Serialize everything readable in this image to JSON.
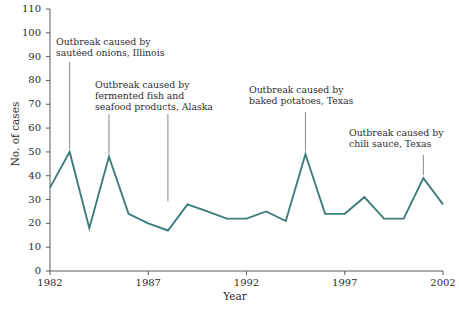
{
  "chart_data": {
    "type": "line",
    "title": "",
    "xlabel": "Year",
    "ylabel": "No. of cases",
    "xlim": [
      1982,
      2002
    ],
    "ylim": [
      0,
      110
    ],
    "grid": false,
    "legend": null,
    "line_color": "#3d7d7d",
    "x": [
      1982,
      1983,
      1984,
      1985,
      1986,
      1987,
      1988,
      1989,
      1990,
      1991,
      1992,
      1993,
      1994,
      1995,
      1996,
      1997,
      1998,
      1999,
      2000,
      2001,
      2002
    ],
    "values": [
      35,
      50,
      18,
      48,
      24,
      20,
      17,
      28,
      25,
      22,
      22,
      25,
      21,
      49,
      24,
      24,
      31,
      22,
      22,
      39,
      28
    ],
    "series": [
      {
        "name": "No. of cases",
        "values": [
          35,
          50,
          18,
          48,
          24,
          20,
          17,
          28,
          25,
          22,
          22,
          25,
          21,
          49,
          24,
          24,
          31,
          22,
          22,
          39,
          28
        ]
      }
    ],
    "y_ticks": [
      0,
      10,
      20,
      30,
      40,
      50,
      60,
      70,
      80,
      90,
      100,
      110
    ],
    "y_tick_labels": [
      "0",
      "10",
      "20",
      "30",
      "40",
      "50",
      "60",
      "70",
      "80",
      "90",
      "100",
      "110"
    ],
    "x_ticks": [
      1982,
      1987,
      1992,
      1997,
      2002
    ],
    "x_tick_labels": [
      "1982",
      "1987",
      "1992",
      "1997",
      "2002"
    ],
    "annotations": [
      {
        "id": "onions",
        "text": "Outbreak caused by\nsautéed onions, Illinois",
        "point_x": 1983,
        "point_y": 50
      },
      {
        "id": "alaska",
        "text": "Outbreak caused by\nfermented fish and\nseafood products, Alaska",
        "point_x": 1985,
        "point_y": 48
      },
      {
        "id": "potatoes",
        "text": "Outbreak caused by\nbaked potatoes, Texas",
        "point_x": 1995,
        "point_y": 49
      },
      {
        "id": "chili",
        "text": "Outbreak caused by\nchili sauce, Texas",
        "point_x": 2001,
        "point_y": 39
      }
    ],
    "extra_leader": {
      "id": "alaska-second",
      "point_x": 1988,
      "point_y": 28
    }
  }
}
